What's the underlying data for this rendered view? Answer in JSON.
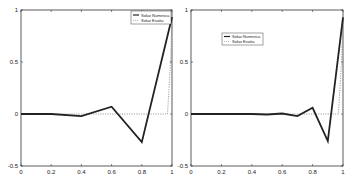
{
  "chart_data": [
    {
      "type": "line",
      "title": "",
      "xlabel": "",
      "ylabel": "",
      "xlim": [
        0,
        1
      ],
      "ylim": [
        -0.5,
        1
      ],
      "x_ticks": [
        "0",
        "0.2",
        "0.4",
        "0.6",
        "0.8",
        "1"
      ],
      "y_ticks": [
        "-0.5",
        "0",
        "0.5",
        "1"
      ],
      "legend_position": "upper right",
      "series": [
        {
          "name": "Soluz Numerica",
          "style": "solid-thick",
          "x": [
            0,
            0.2,
            0.4,
            0.6,
            0.8,
            1.0
          ],
          "y": [
            0,
            0.0,
            -0.02,
            0.07,
            -0.27,
            0.93
          ]
        },
        {
          "name": "Soluz Esatta",
          "style": "dotted",
          "x": [
            0,
            0.2,
            0.4,
            0.6,
            0.8,
            0.97,
            0.99,
            1.0
          ],
          "y": [
            0,
            0,
            0,
            0,
            0,
            0,
            0.5,
            0.93
          ]
        }
      ]
    },
    {
      "type": "line",
      "title": "",
      "xlabel": "",
      "ylabel": "",
      "xlim": [
        0,
        1
      ],
      "ylim": [
        -0.5,
        1
      ],
      "x_ticks": [
        "0",
        "0.2",
        "0.4",
        "0.6",
        "0.8",
        "1"
      ],
      "y_ticks": [
        "-0.5",
        "0",
        "0.5",
        "1"
      ],
      "legend_position": "upper left",
      "series": [
        {
          "name": "Soluz Numerica",
          "style": "solid-thick",
          "x": [
            0,
            0.1,
            0.2,
            0.3,
            0.4,
            0.5,
            0.6,
            0.7,
            0.8,
            0.9,
            1.0
          ],
          "y": [
            0,
            0,
            0,
            0,
            0,
            -0.005,
            0.005,
            -0.02,
            0.06,
            -0.26,
            0.93
          ]
        },
        {
          "name": "Soluz Esatta",
          "style": "dotted",
          "x": [
            0,
            0.2,
            0.4,
            0.6,
            0.8,
            0.97,
            0.99,
            1.0
          ],
          "y": [
            0,
            0,
            0,
            0,
            0,
            0,
            0.5,
            0.93
          ]
        }
      ]
    }
  ],
  "legend": {
    "numerica": "Soluz Numerica",
    "esatta": "Soluz Esatta"
  },
  "ticks": {
    "x": [
      "0",
      "0.2",
      "0.4",
      "0.6",
      "0.8",
      "1"
    ],
    "y": [
      "1",
      "0.5",
      "0",
      "-0.5"
    ]
  }
}
